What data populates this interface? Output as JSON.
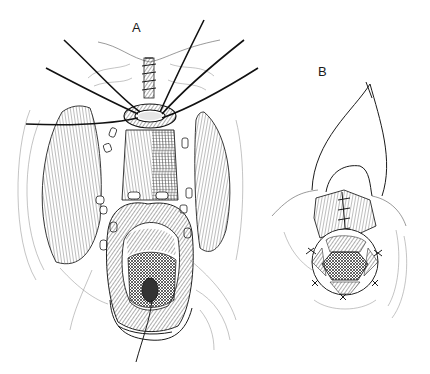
{
  "figure": {
    "panels": [
      {
        "id": "A",
        "label": "A",
        "description": "Exposed surgical field with circular retractor ring, sutures radiating outward, bilateral muscle bellies and central opening with mesh-shaded tissue"
      },
      {
        "id": "B",
        "label": "B",
        "description": "Closure detail showing looped suture over a sutured flap with a hexagonal mesh-shaded opening below"
      }
    ],
    "colors": {
      "ink": "#1a1a1a",
      "background": "#ffffff",
      "shade": "#555555"
    }
  }
}
